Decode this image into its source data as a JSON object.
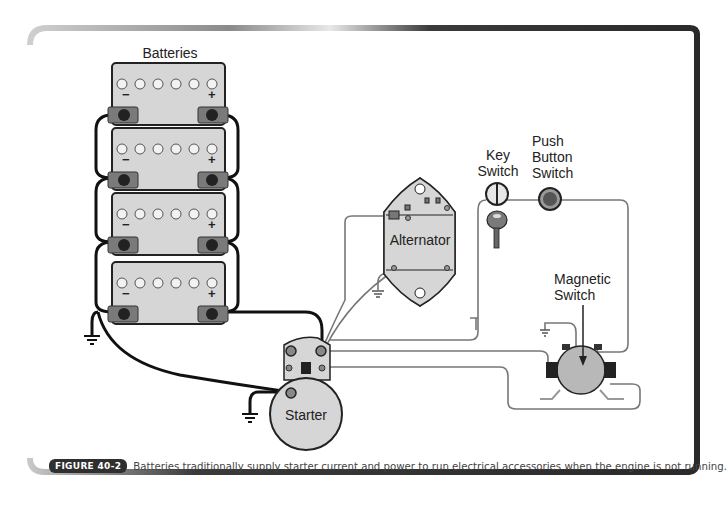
{
  "figure": {
    "badge": "FIGURE 40-2",
    "caption": "Batteries traditionally supply starter current and power to run electrical accessories when the engine is not running."
  },
  "labels": {
    "batteries": "Batteries",
    "alternator": "Alternator",
    "starter": "Starter",
    "key_switch_line1": "Key",
    "key_switch_line2": "Switch",
    "push_button_line1": "Push",
    "push_button_line2": "Button",
    "push_button_line3": "Switch",
    "magnetic_switch_line1": "Magnetic",
    "magnetic_switch_line2": "Switch"
  },
  "batteries": [
    {
      "index": 1,
      "cells": 6,
      "negative": "−",
      "positive": "+"
    },
    {
      "index": 2,
      "cells": 6,
      "negative": "−",
      "positive": "+"
    },
    {
      "index": 3,
      "cells": 6,
      "negative": "−",
      "positive": "+"
    },
    {
      "index": 4,
      "cells": 6,
      "negative": "−",
      "positive": "+"
    }
  ],
  "colors": {
    "frame_dark": "#2a2a2a",
    "component_fill": "#d6d6d6",
    "wire_heavy": "#111111",
    "wire_light": "#777777",
    "caption_badge": "#2f2f2f"
  }
}
